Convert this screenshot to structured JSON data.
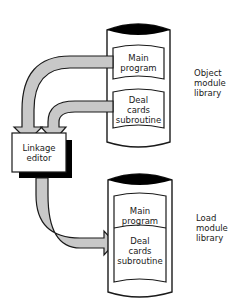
{
  "diagram": {
    "object_library": {
      "label_lines": [
        "Object",
        "module",
        "library"
      ],
      "modules": [
        {
          "lines": [
            "Main",
            "program"
          ]
        },
        {
          "lines": [
            "Deal",
            "cards",
            "subroutine"
          ]
        }
      ]
    },
    "linkage_editor": {
      "label_lines": [
        "Linkage",
        "editor"
      ]
    },
    "load_library": {
      "label_lines": [
        "Load",
        "module",
        "library"
      ],
      "modules": [
        {
          "lines": [
            "Main",
            "program"
          ]
        },
        {
          "lines": [
            "Deal",
            "cards",
            "subroutine"
          ]
        }
      ]
    },
    "colors": {
      "arrow_fill": "#c8c8c8",
      "outline": "#1a1a1a",
      "shadow": "#000000",
      "background": "#ffffff"
    }
  }
}
